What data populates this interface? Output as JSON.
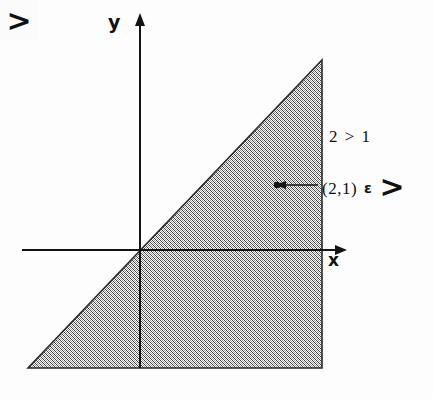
{
  "figure": {
    "background_color": "#fdfdfd",
    "ink_color": "#111111",
    "hatch_color": "#4a4a4a",
    "axes": {
      "x_label": "x",
      "y_label": "y",
      "origin": {
        "x": 140,
        "y": 250
      },
      "x_axis_start_x": 22,
      "x_axis_end_x": 347,
      "y_axis_top_y": 14,
      "y_axis_bottom_y": 368
    },
    "region": {
      "name": "shaded-triangle",
      "fill": "diagonal-crosshatch",
      "vertices": [
        {
          "x": 28,
          "y": 368
        },
        {
          "x": 322,
          "y": 368
        },
        {
          "x": 322,
          "y": 60
        }
      ],
      "inner_symbol": ">"
    },
    "annotations": {
      "relation": "2 > 1",
      "membership_point": "(2,1)",
      "membership_operator": "ε",
      "membership_set": ">",
      "marker_point": {
        "x": 277,
        "y": 185
      },
      "leader_line": {
        "from_x": 318,
        "to_x": 277,
        "y": 185
      }
    }
  }
}
